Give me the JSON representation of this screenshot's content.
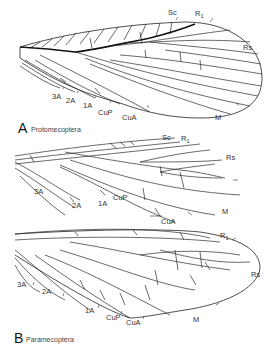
{
  "figure": {
    "panels": [
      {
        "letter": "A",
        "name": "Protomecoptera",
        "vein_labels": {
          "sc": "Sc",
          "r1": "R",
          "r1_sub": "1",
          "rs": "Rs",
          "m": "M",
          "cua": "CuA",
          "cup": "CuP",
          "a1": "1A",
          "a2": "2A",
          "a3": "3A"
        }
      },
      {
        "letter": "",
        "name": "",
        "vein_labels": {
          "sc": "Sc",
          "r1": "R",
          "r1_sub": "1",
          "rs": "Rs",
          "m": "M",
          "cua": "CuA",
          "cup": "CuP",
          "a1": "1A",
          "a2": "2A",
          "a3": "3A"
        }
      },
      {
        "letter": "B",
        "name": "Paramecoptera",
        "vein_labels": {
          "r1": "R",
          "r1_sub": "1",
          "rs": "Rs",
          "m": "M",
          "cua": "CuA",
          "cup": "CuP",
          "a1": "1A",
          "a2": "2A",
          "a3": "3A"
        }
      }
    ]
  }
}
